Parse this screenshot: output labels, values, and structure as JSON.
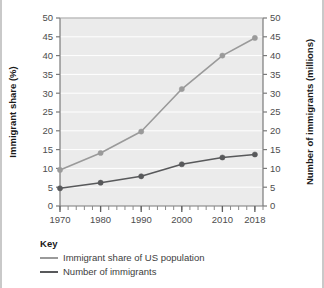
{
  "chart_data": {
    "type": "line",
    "title": "",
    "xlabel": "",
    "ylabel": "Immigrant share (%)",
    "y2label": "Number of immigrants (millions)",
    "x": [
      1970,
      1980,
      1990,
      2000,
      2010,
      2018
    ],
    "xtick_labels": [
      "1970",
      "1980",
      "1990",
      "2000",
      "2010",
      "2018"
    ],
    "ylim": [
      0,
      50
    ],
    "y2lim": [
      0,
      50
    ],
    "ytick_labels": [
      "0",
      "5",
      "10",
      "15",
      "20",
      "25",
      "30",
      "35",
      "40",
      "45",
      "50"
    ],
    "y2tick_labels": [
      "0",
      "5",
      "10",
      "15",
      "20",
      "25",
      "30",
      "35",
      "40",
      "45",
      "50"
    ],
    "ytick_values": [
      0,
      5,
      10,
      15,
      20,
      25,
      30,
      35,
      40,
      45,
      50
    ],
    "grid": true,
    "grid_color": "#ffffff",
    "plot_background": "#ebebeb",
    "legend_position": "below-left",
    "minor_ticks_x": true,
    "series": [
      {
        "name": "Immigrant share of US population",
        "axis": "left",
        "color": "#58595b",
        "values": [
          4.7,
          6.2,
          7.9,
          11.1,
          12.9,
          13.7
        ],
        "markers": true
      },
      {
        "name": "Number of immigrants",
        "axis": "right",
        "color": "#9a9a9a",
        "values": [
          9.6,
          14.1,
          19.8,
          31.1,
          40.0,
          44.7
        ],
        "markers": true
      }
    ]
  },
  "legend": {
    "title": "Key",
    "entries": [
      {
        "label": "Immigrant share of US population",
        "color": "#9a9a9a"
      },
      {
        "label": "Number of immigrants",
        "color": "#58595b"
      }
    ]
  },
  "axes": {
    "left_title": "Immigrant share (%)",
    "right_title": "Number of immigrants (millions)"
  }
}
